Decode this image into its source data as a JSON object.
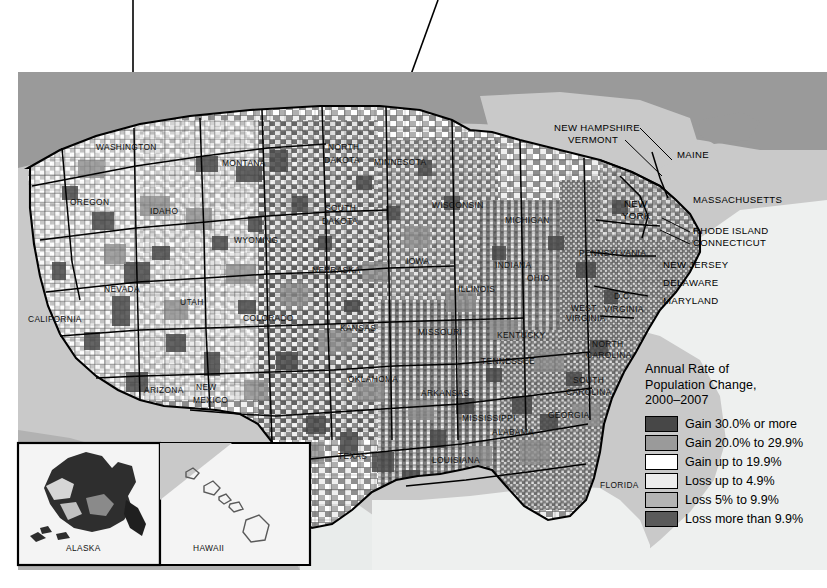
{
  "figure": {
    "type": "choropleth-map"
  },
  "legend": {
    "title_lines": [
      "Annual Rate of",
      "Population Change,",
      "2000–2007"
    ],
    "items": [
      {
        "label": "Gain 30.0% or more",
        "color": "#474747"
      },
      {
        "label": "Gain 20.0% to 29.9%",
        "color": "#9a9a9a"
      },
      {
        "label": "Gain up to 19.9%",
        "color": "#ffffff"
      },
      {
        "label": "Loss up to 4.9%",
        "color": "#ededed"
      },
      {
        "label": "Loss 5% to 9.9%",
        "color": "#b4b4b4"
      },
      {
        "label": "Loss more than 9.9%",
        "color": "#5a5a5a"
      }
    ]
  },
  "insets": {
    "alaska_label": "ALASKA",
    "hawaii_label": "HAWAII"
  },
  "state_labels": [
    {
      "name": "WASHINGTON",
      "x": 96,
      "y": 150
    },
    {
      "name": "OREGON",
      "x": 70,
      "y": 205
    },
    {
      "name": "IDAHO",
      "x": 150,
      "y": 214
    },
    {
      "name": "MONTANA",
      "x": 222,
      "y": 166
    },
    {
      "name": "WYOMING",
      "x": 234,
      "y": 243
    },
    {
      "name": "NEVADA",
      "x": 104,
      "y": 292
    },
    {
      "name": "UTAH",
      "x": 180,
      "y": 305
    },
    {
      "name": "CALIFORNIA",
      "x": 28,
      "y": 322
    },
    {
      "name": "ARIZONA",
      "x": 144,
      "y": 393
    },
    {
      "name": "NEW",
      "x": 196,
      "y": 390
    },
    {
      "name": "MEXICO",
      "x": 193,
      "y": 403
    },
    {
      "name": "COLORADO",
      "x": 243,
      "y": 321
    },
    {
      "name": "NORTH",
      "x": 328,
      "y": 150
    },
    {
      "name": "DAKOTA",
      "x": 324,
      "y": 163
    },
    {
      "name": "SOUTH",
      "x": 325,
      "y": 211
    },
    {
      "name": "DAKOTA",
      "x": 322,
      "y": 224
    },
    {
      "name": "NEBRASKA",
      "x": 312,
      "y": 273
    },
    {
      "name": "KANSAS",
      "x": 340,
      "y": 331
    },
    {
      "name": "OKLAHOMA",
      "x": 348,
      "y": 382
    },
    {
      "name": "TEXAS",
      "x": 338,
      "y": 459
    },
    {
      "name": "MINNESOTA",
      "x": 374,
      "y": 165
    },
    {
      "name": "IOWA",
      "x": 406,
      "y": 264
    },
    {
      "name": "MISSOURI",
      "x": 418,
      "y": 335
    },
    {
      "name": "ARKANSAS",
      "x": 421,
      "y": 396
    },
    {
      "name": "LOUISIANA",
      "x": 432,
      "y": 463
    },
    {
      "name": "MISSISSIPPI",
      "x": 462,
      "y": 421
    },
    {
      "name": "ALABAMA",
      "x": 492,
      "y": 435
    },
    {
      "name": "WISCONSIN",
      "x": 432,
      "y": 208
    },
    {
      "name": "ILLINOIS",
      "x": 458,
      "y": 292
    },
    {
      "name": "MICHIGAN",
      "x": 505,
      "y": 223
    },
    {
      "name": "INDIANA",
      "x": 495,
      "y": 268
    },
    {
      "name": "OHIO",
      "x": 527,
      "y": 281
    },
    {
      "name": "KENTUCKY",
      "x": 497,
      "y": 338
    },
    {
      "name": "TENNESSEE",
      "x": 481,
      "y": 364
    },
    {
      "name": "GEORGIA",
      "x": 548,
      "y": 418
    },
    {
      "name": "FLORIDA",
      "x": 600,
      "y": 488
    },
    {
      "name": "SOUTH",
      "x": 573,
      "y": 383
    },
    {
      "name": "CAROLINA",
      "x": 566,
      "y": 395
    },
    {
      "name": "NORTH",
      "x": 592,
      "y": 347
    },
    {
      "name": "CAROLINA",
      "x": 586,
      "y": 358
    },
    {
      "name": "WEST",
      "x": 571,
      "y": 311
    },
    {
      "name": "VIRGINIA",
      "x": 566,
      "y": 321
    },
    {
      "name": "VIRGINIA",
      "x": 604,
      "y": 312
    },
    {
      "name": "D.C.",
      "x": 614,
      "y": 299
    },
    {
      "name": "PENNSYLVANIA",
      "x": 579,
      "y": 256
    }
  ],
  "northeast_labels": [
    {
      "name": "NEW HAMPSHIRE",
      "x": 554,
      "y": 131
    },
    {
      "name": "VERMONT",
      "x": 568,
      "y": 143
    },
    {
      "name": "MAINE",
      "x": 677,
      "y": 158
    },
    {
      "name": "MASSACHUSETTS",
      "x": 693,
      "y": 203
    },
    {
      "name": "NEW",
      "x": 624,
      "y": 207
    },
    {
      "name": "YORK",
      "x": 622,
      "y": 219
    },
    {
      "name": "RHODE ISLAND",
      "x": 693,
      "y": 234
    },
    {
      "name": "CONNECTICUT",
      "x": 693,
      "y": 246
    },
    {
      "name": "NEW JERSEY",
      "x": 663,
      "y": 268
    },
    {
      "name": "DELAWARE",
      "x": 663,
      "y": 286
    },
    {
      "name": "MARYLAND",
      "x": 663,
      "y": 304
    }
  ],
  "colors": {
    "ocean": "#c9c9c9",
    "canada": "#9a9a9a",
    "paper": "#f6f6f6",
    "border": "#000000",
    "leader": "#000000"
  }
}
